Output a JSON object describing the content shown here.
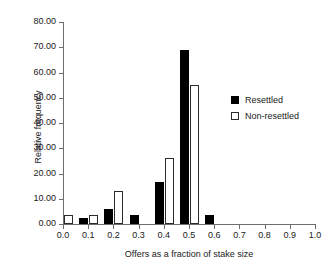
{
  "chart_data": {
    "type": "bar",
    "title": "",
    "subtitle": "",
    "xlabel": "Offers as a fraction of stake size",
    "ylabel": "Relative frequency",
    "xlim": [
      0.0,
      1.0
    ],
    "ylim": [
      0.0,
      80.0
    ],
    "grid": false,
    "legend_position": "right",
    "x_tick_labels": [
      "0.0",
      "0.1",
      "0.2",
      "0.3",
      "0.4",
      "0.5",
      "0.6",
      "0.7",
      "0.8",
      "0.9",
      "1.0"
    ],
    "x_tick_values": [
      0.0,
      0.1,
      0.2,
      0.3,
      0.4,
      0.5,
      0.6,
      0.7,
      0.8,
      0.9,
      1.0
    ],
    "y_tick_labels": [
      "0.00",
      "10.00",
      "20.00",
      "30.00",
      "40.00",
      "50.00",
      "60.00",
      "70.00",
      "80.00"
    ],
    "y_tick_values": [
      0,
      10,
      20,
      30,
      40,
      50,
      60,
      70,
      80
    ],
    "categories": [
      "0.0",
      "0.1",
      "0.2",
      "0.3",
      "0.4",
      "0.5",
      "0.6",
      "0.7",
      "0.8",
      "0.9",
      "1.0"
    ],
    "series": [
      {
        "name": "Resettled",
        "color": "#000000",
        "style": "filled",
        "values": [
          0,
          2.5,
          6.0,
          3.7,
          16.5,
          69.0,
          3.7,
          0,
          0,
          0,
          0
        ]
      },
      {
        "name": "Non-resettled",
        "color": "#ffffff",
        "style": "open",
        "values": [
          3.5,
          3.5,
          13.0,
          0,
          26.0,
          55.0,
          0,
          0,
          0,
          0,
          0
        ]
      }
    ]
  },
  "legend": {
    "entries": [
      {
        "label": "Resettled",
        "style": "filled"
      },
      {
        "label": "Non-resettled",
        "style": "open"
      }
    ]
  },
  "colors": {
    "axis": "#6e6e6e",
    "text": "#1a1a1a",
    "filled_bar": "#000000",
    "open_bar_border": "#2b2b2b",
    "background": "#ffffff"
  }
}
